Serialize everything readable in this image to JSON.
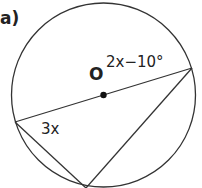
{
  "part_label": "a)",
  "center_label": "O",
  "angle_labels": {
    "right_vertex": "2x−10°",
    "left_vertex": "3x"
  },
  "colors": {
    "stroke": "#333333",
    "text": "#222222",
    "background": "#ffffff"
  }
}
